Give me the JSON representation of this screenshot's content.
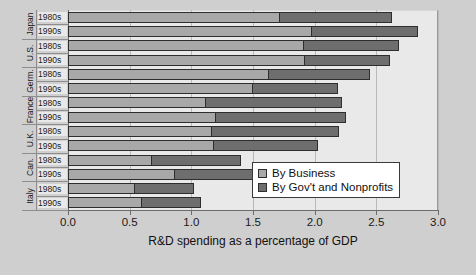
{
  "chart_data": {
    "type": "bar",
    "orientation": "horizontal",
    "stacked": true,
    "title": "",
    "xlabel": "R&D spending as a percentage of GDP",
    "ylabel": "",
    "xlim": [
      0.0,
      3.0
    ],
    "xticks": [
      "0.0",
      "0.5",
      "1.0",
      "1.5",
      "2.0",
      "2.5",
      "3.0"
    ],
    "xtick_values": [
      0.0,
      0.5,
      1.0,
      1.5,
      2.0,
      2.5,
      3.0
    ],
    "grid": true,
    "grid_axis": "x",
    "legend_position": "bottom-right",
    "series": [
      {
        "name": "By Business",
        "color": "#a8a8a8",
        "values": [
          1.72,
          1.98,
          1.91,
          1.92,
          1.63,
          1.5,
          1.12,
          1.2,
          1.17,
          1.18,
          0.68,
          0.87,
          0.54,
          0.6
        ]
      },
      {
        "name": "By Gov't and Nonprofits",
        "color": "#6e6e6e",
        "values": [
          0.91,
          0.86,
          0.77,
          0.69,
          0.82,
          0.69,
          1.1,
          1.05,
          1.03,
          0.85,
          0.72,
          0.73,
          0.48,
          0.48
        ]
      }
    ],
    "categories": [
      "Japan 1980s",
      "Japan 1990s",
      "U.S. 1980s",
      "U.S. 1990s",
      "Germ. 1980s",
      "Germ. 1990s",
      "France 1980s",
      "France 1990s",
      "U.K. 1980s",
      "U.K. 1990s",
      "Can. 1980s",
      "Can. 1990s",
      "Italy 1980s",
      "Italy 1990s"
    ],
    "totals": [
      2.63,
      2.84,
      2.68,
      2.61,
      2.45,
      2.19,
      2.22,
      2.25,
      2.2,
      2.03,
      1.4,
      1.6,
      1.02,
      1.08
    ],
    "countries": [
      {
        "name": "Japan",
        "decades": [
          "1980s",
          "1990s"
        ]
      },
      {
        "name": "U.S.",
        "decades": [
          "1980s",
          "1990s"
        ]
      },
      {
        "name": "Germ.",
        "decades": [
          "1980s",
          "1990s"
        ]
      },
      {
        "name": "France",
        "decades": [
          "1980s",
          "1990s"
        ]
      },
      {
        "name": "U.K.",
        "decades": [
          "1980s",
          "1990s"
        ]
      },
      {
        "name": "Can.",
        "decades": [
          "1980s",
          "1990s"
        ]
      },
      {
        "name": "Italy",
        "decades": [
          "1980s",
          "1990s"
        ]
      }
    ]
  },
  "legend": {
    "items": [
      {
        "label": "By Business",
        "color": "#a8a8a8"
      },
      {
        "label": "By Gov't and Nonprofits",
        "color": "#6e6e6e"
      }
    ]
  },
  "colors": {
    "figure_background": "#cfcfcf",
    "plot_background": "#e9e9e9",
    "business": "#a8a8a8",
    "government": "#6e6e6e",
    "gridline": "#b9b9b9",
    "axis": "#6b6b6b",
    "text": "#1a1a1a"
  }
}
